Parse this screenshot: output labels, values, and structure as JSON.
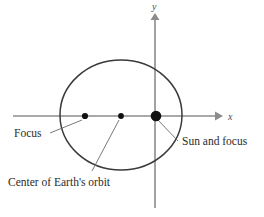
{
  "figure": {
    "background_color": "#ffffff",
    "axes": {
      "x_label": "x",
      "y_label": "y",
      "axis_color": "#8c8c8c",
      "x_axis": {
        "x1": 13,
        "y1": 116,
        "x2": 222,
        "y2": 116,
        "arrow": "right"
      },
      "y_axis": {
        "x1": 155,
        "y1": 208,
        "x2": 155,
        "y2": 14,
        "arrow": "up"
      }
    },
    "orbit": {
      "shape": "ellipse",
      "stroke_color": "#3a3a3a",
      "center_x": 121,
      "center_y": 115,
      "radius_x": 61,
      "radius_y": 55
    },
    "points": [
      {
        "name": "focus-left",
        "x": 85,
        "y": 116,
        "radius": 3.1,
        "color": "#111111"
      },
      {
        "name": "orbit-center",
        "x": 121,
        "y": 116,
        "radius": 2.9,
        "color": "#111111"
      },
      {
        "name": "sun-focus",
        "x": 156,
        "y": 116,
        "radius": 5.3,
        "color": "#111111"
      }
    ],
    "labels": [
      {
        "name": "focus-label",
        "text": "Focus",
        "x": 14,
        "y": 137,
        "anchor": "start",
        "leader": {
          "x1": 50,
          "y1": 133,
          "x2": 82,
          "y2": 120
        }
      },
      {
        "name": "orbit-center-label",
        "text": "Center of Earth's orbit",
        "x": 8,
        "y": 186,
        "anchor": "start",
        "leader": {
          "x1": 92,
          "y1": 171,
          "x2": 119,
          "y2": 120
        }
      },
      {
        "name": "sun-focus-label",
        "text": "Sun and focus",
        "x": 182,
        "y": 145,
        "anchor": "start",
        "leader": {
          "x1": 178,
          "y1": 141,
          "x2": 158,
          "y2": 120
        }
      }
    ],
    "leader_color": "#6a6a6a"
  }
}
